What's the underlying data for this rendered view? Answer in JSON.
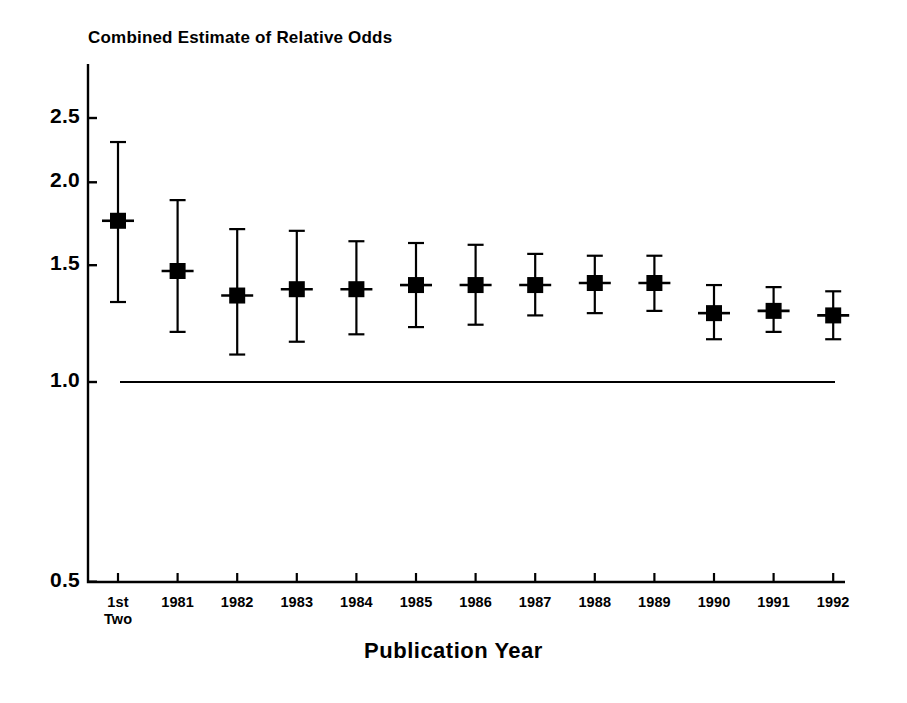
{
  "chart_data": {
    "type": "scatter",
    "title": "Combined Estimate of Relative Odds",
    "subtitle": "",
    "xlabel": "Publication Year",
    "ylabel": "",
    "yscale": "log",
    "ylim": [
      0.5,
      2.75
    ],
    "yticks": [
      2.5,
      2.0,
      1.5,
      1.0,
      0.5
    ],
    "ytick_labels": [
      "2.5",
      "2.0",
      "1.5",
      "1.0",
      "0.5"
    ],
    "grid": false,
    "legend": null,
    "reference_line": {
      "value": 1.0,
      "label": "1.0",
      "style": "solid"
    },
    "categories": [
      "1st\nTwo",
      "1981",
      "1982",
      "1983",
      "1984",
      "1985",
      "1986",
      "1987",
      "1988",
      "1989",
      "1990",
      "1991",
      "1992"
    ],
    "category_labels": [
      {
        "line1": "1st",
        "line2": "Two"
      },
      {
        "line1": "1981",
        "line2": ""
      },
      {
        "line1": "1982",
        "line2": ""
      },
      {
        "line1": "1983",
        "line2": ""
      },
      {
        "line1": "1984",
        "line2": ""
      },
      {
        "line1": "1985",
        "line2": ""
      },
      {
        "line1": "1986",
        "line2": ""
      },
      {
        "line1": "1987",
        "line2": ""
      },
      {
        "line1": "1988",
        "line2": ""
      },
      {
        "line1": "1989",
        "line2": ""
      },
      {
        "line1": "1990",
        "line2": ""
      },
      {
        "line1": "1991",
        "line2": ""
      },
      {
        "line1": "1992",
        "line2": ""
      }
    ],
    "series": [
      {
        "name": "Combined estimate of relative odds",
        "marker": "filled-square",
        "error_bars": "95% confidence interval",
        "values": [
          1.75,
          1.47,
          1.35,
          1.38,
          1.38,
          1.4,
          1.4,
          1.4,
          1.41,
          1.41,
          1.27,
          1.28,
          1.26
        ],
        "lower": [
          1.32,
          1.19,
          1.1,
          1.15,
          1.18,
          1.21,
          1.22,
          1.26,
          1.27,
          1.28,
          1.16,
          1.19,
          1.16
        ],
        "upper": [
          2.3,
          1.88,
          1.7,
          1.69,
          1.63,
          1.62,
          1.61,
          1.56,
          1.55,
          1.55,
          1.4,
          1.39,
          1.37
        ]
      }
    ]
  },
  "colors": {
    "foreground": "#000000",
    "background": "#ffffff",
    "marker": "#000000"
  }
}
